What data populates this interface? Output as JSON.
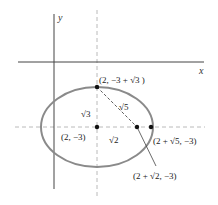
{
  "figure": {
    "type": "ellipse-diagram",
    "axes": {
      "x_label": "x",
      "y_label": "y"
    },
    "ellipse": {
      "center": "(2, -3)",
      "semi_major": "√5",
      "semi_minor": "√3",
      "focal_distance": "√2",
      "stroke_color": "#8a8a8a"
    },
    "points": [
      {
        "id": "top-vertex",
        "label": "(2, −3 + √3 )"
      },
      {
        "id": "center",
        "label": "(2, −3)"
      },
      {
        "id": "focus",
        "label": "(2 + √2, −3)"
      },
      {
        "id": "right-vertex",
        "label": "(2 + √5, −3)"
      }
    ],
    "segment_labels": {
      "vertical": "√3",
      "horizontal": "√2",
      "hypotenuse": "√5"
    },
    "colors": {
      "axis": "#444444",
      "dashed": "#9a9a9a",
      "point": "#111111",
      "text": "#222222"
    }
  }
}
